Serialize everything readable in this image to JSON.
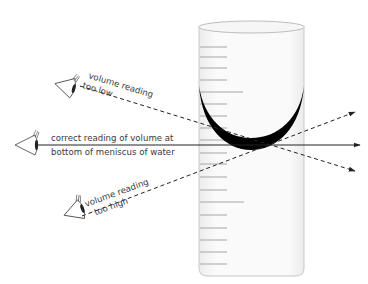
{
  "diagram": {
    "labels": {
      "correct_line1": "correct reading of volume at",
      "correct_line2": "bottom of meniscus of water",
      "low_line1": "volume reading",
      "low_line2": "too low",
      "high_line1": "volume reading",
      "high_line2": "too high"
    },
    "sight_lines": [
      {
        "name": "too low",
        "style": "dashed"
      },
      {
        "name": "correct",
        "style": "solid"
      },
      {
        "name": "too high",
        "style": "dashed"
      }
    ],
    "colors": {
      "line": "#222222",
      "meniscus": "#000000",
      "cylinder_outline": "#c8c8c8",
      "graduation": "#a0a0a0",
      "text": "#3a3a3a"
    }
  }
}
